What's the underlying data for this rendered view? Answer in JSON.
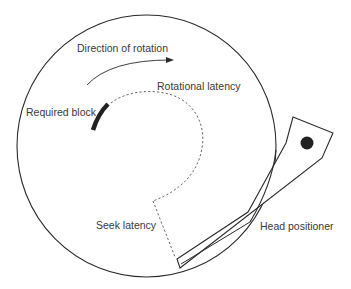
{
  "diagram": {
    "type": "disk-access-latency",
    "labels": {
      "direction": "Direction of rotation",
      "rotational": "Rotational latency",
      "required_block": "Required block",
      "seek": "Seek latency",
      "head": "Head positioner"
    },
    "colors": {
      "stroke": "#2a2a2a",
      "text": "#3a3a3a",
      "dashed": "#555555",
      "fill_dark": "#222222",
      "background": "#ffffff"
    }
  }
}
